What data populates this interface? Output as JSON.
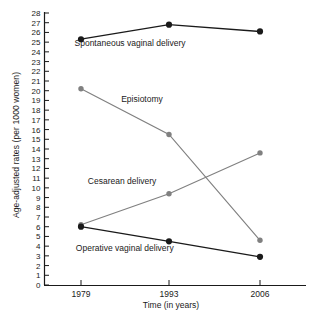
{
  "chart_data": {
    "type": "line",
    "title": "",
    "xlabel": "Time (in years)",
    "ylabel": "Age-adjusted rates (per 1000 women)",
    "categories": [
      "1979",
      "1993",
      "2006"
    ],
    "x": [
      1979,
      1993,
      2006
    ],
    "xlim": [
      1979,
      2006
    ],
    "ylim": [
      0,
      28
    ],
    "ytick_step": 1,
    "yticks": [
      "0",
      "1",
      "2",
      "3",
      "4",
      "5",
      "6",
      "7",
      "8",
      "9",
      "10",
      "11",
      "12",
      "13",
      "14",
      "15",
      "16",
      "17",
      "18",
      "19",
      "20",
      "21",
      "22",
      "23",
      "24",
      "25",
      "26",
      "27",
      "28"
    ],
    "grid": false,
    "legend": "inline-labels",
    "series": [
      {
        "name": "Spontaneous vaginal delivery",
        "values": [
          25.3,
          26.8,
          26.1
        ],
        "color": "#1a1a1a",
        "marker": "circle-filled",
        "label_x": 1986.4,
        "label_y": 24.6,
        "label_anchor": "middle"
      },
      {
        "name": "Episiotomy",
        "values": [
          20.2,
          15.5,
          4.6
        ],
        "color": "#808080",
        "marker": "circle-filled",
        "label_x": 1988.2,
        "label_y": 18.8,
        "label_anchor": "middle"
      },
      {
        "name": "Cesarean delivery",
        "values": [
          6.2,
          9.4,
          13.6
        ],
        "color": "#808080",
        "marker": "circle-filled",
        "label_x": 1985.2,
        "label_y": 10.4,
        "label_anchor": "middle"
      },
      {
        "name": "Operative vaginal delivery",
        "values": [
          6.0,
          4.5,
          2.9
        ],
        "color": "#1a1a1a",
        "marker": "circle-filled",
        "label_x": 1985.6,
        "label_y": 3.5,
        "label_anchor": "middle"
      }
    ]
  }
}
